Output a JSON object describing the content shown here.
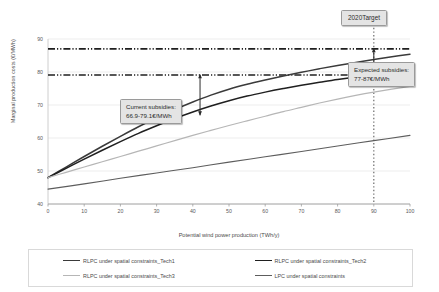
{
  "chart_data": {
    "type": "line",
    "title": "",
    "xlabel": "Potential wind power production (TWh/y)",
    "ylabel": "Marginal production costs (€/MWh)",
    "xlim": [
      0,
      100
    ],
    "ylim": [
      40,
      90
    ],
    "xticks": [
      0,
      10,
      20,
      30,
      40,
      50,
      60,
      70,
      80,
      90,
      100
    ],
    "yticks": [
      40,
      50,
      60,
      70,
      80,
      90
    ],
    "grid": true,
    "legend_position": "bottom",
    "series": [
      {
        "name": "RLPC under spatial constraints_Tech1",
        "color": "#3a3a3a",
        "width": 1.5,
        "x": [
          0,
          5,
          10,
          15,
          20,
          25,
          30,
          35,
          40,
          45,
          50,
          55,
          60,
          65,
          70,
          75,
          80,
          85,
          90,
          95,
          100
        ],
        "y": [
          48.0,
          51.2,
          54.4,
          57.5,
          60.5,
          63.4,
          66.1,
          68.6,
          70.9,
          73.0,
          74.8,
          76.3,
          77.6,
          78.8,
          79.9,
          81.0,
          82.0,
          82.9,
          83.8,
          84.6,
          85.4
        ]
      },
      {
        "name": "RLPC under spatial constraints_Tech2",
        "color": "#1f1f1f",
        "width": 1.5,
        "x": [
          0,
          5,
          10,
          15,
          20,
          25,
          30,
          35,
          40,
          45,
          50,
          55,
          60,
          65,
          70,
          75,
          80,
          85,
          90,
          95,
          100
        ],
        "y": [
          48.0,
          50.8,
          53.6,
          56.3,
          58.9,
          61.4,
          63.7,
          65.9,
          67.9,
          69.7,
          71.3,
          72.7,
          73.9,
          75.0,
          76.0,
          76.9,
          77.7,
          78.5,
          79.2,
          79.9,
          80.6
        ]
      },
      {
        "name": "RLPC under spatial constraints_Tech3",
        "color": "#b6b6b6",
        "width": 1.2,
        "x": [
          0,
          5,
          10,
          15,
          20,
          25,
          30,
          35,
          40,
          45,
          50,
          55,
          60,
          65,
          70,
          75,
          80,
          85,
          90,
          95,
          100
        ],
        "y": [
          48.0,
          49.6,
          51.2,
          52.8,
          54.4,
          56.0,
          57.6,
          59.2,
          60.8,
          62.3,
          63.8,
          65.2,
          66.6,
          68.0,
          69.3,
          70.6,
          71.8,
          72.9,
          73.9,
          74.8,
          75.6
        ]
      },
      {
        "name": "LPC under spatial constraints",
        "color": "#5d5d5d",
        "width": 1.1,
        "x": [
          0,
          10,
          20,
          30,
          40,
          50,
          60,
          70,
          80,
          90,
          100
        ],
        "y": [
          44.5,
          46.1,
          47.8,
          49.4,
          51.0,
          52.7,
          54.3,
          55.9,
          57.6,
          59.2,
          60.8
        ]
      }
    ],
    "reference_lines": [
      {
        "name": "expected-subsidy-upper",
        "axis": "y",
        "value": 87.0,
        "style": "dash-dot",
        "color": "#1f1f1f"
      },
      {
        "name": "current-subsidy-upper",
        "axis": "y",
        "value": 79.1,
        "style": "dash-dot",
        "color": "#1f1f1f"
      },
      {
        "name": "2020-target",
        "axis": "x",
        "value": 90.0,
        "style": "dotted",
        "color": "#6b6b6b"
      }
    ],
    "annotations": [
      {
        "name": "current-subsidies",
        "text_line1": "Current subsidies:",
        "text_line2": "66.9-79.1€/MWh",
        "arrow_x": 42.0,
        "arrow_from": 79.1,
        "arrow_to": 66.9
      },
      {
        "name": "expected-subsidies",
        "text_line1": "Expected subsidies:",
        "text_line2": "77-87€/MWh",
        "arrow_x": 90.0,
        "arrow_from": 87.0,
        "arrow_to": 77.0
      },
      {
        "name": "2020-target",
        "text_line1": "2020Target",
        "text_line2": ""
      }
    ]
  },
  "axes": {
    "x_title": "Potential wind power production (TWh/y)",
    "y_title": "Marginal production costs (€/MWh)",
    "x_ticks": [
      "0",
      "10",
      "20",
      "30",
      "40",
      "50",
      "60",
      "70",
      "80",
      "90",
      "100"
    ],
    "y_ticks": [
      "90",
      "80",
      "70",
      "60",
      "50",
      "40"
    ]
  },
  "callouts": {
    "current": {
      "line1": "Current subsidies:",
      "line2": "66.9-79.1€/MWh"
    },
    "expected": {
      "line1": "Expected subsidies:",
      "line2": "77-87€/MWh"
    },
    "target": {
      "label": "2020Target"
    }
  },
  "legend": {
    "items": [
      {
        "label": "RLPC under spatial constraints_Tech1",
        "color": "#3a3a3a",
        "width": "1.6px"
      },
      {
        "label": "RLPC under spatial constraints_Tech2",
        "color": "#1f1f1f",
        "width": "1.6px"
      },
      {
        "label": "RLPC under spatial constraints_Tech3",
        "color": "#b6b6b6",
        "width": "1.1px"
      },
      {
        "label": "LPC under spatial constraints",
        "color": "#5d5d5d",
        "width": "1.1px"
      }
    ]
  }
}
